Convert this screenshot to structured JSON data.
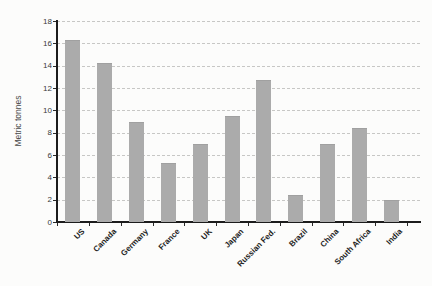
{
  "chart": {
    "ylabel": "Metric tonnes",
    "colors": {
      "bar": "#ababab",
      "axis": "#1c1c1c",
      "grid": "#c7c7c5",
      "y_tick_label": "#3a3a3a",
      "x_tick_label": "#222222",
      "background": "#fcfcfb"
    }
  },
  "chart_data": {
    "type": "bar",
    "categories": [
      "US",
      "Canada",
      "Germany",
      "France",
      "UK",
      "Japan",
      "Russian Fed.",
      "Brazil",
      "China",
      "South Africa",
      "India"
    ],
    "values": [
      16.3,
      14.2,
      9.0,
      5.3,
      7.0,
      9.5,
      12.7,
      2.4,
      7.0,
      8.4,
      2.0
    ],
    "title": "",
    "xlabel": "",
    "ylabel": "Metric tonnes",
    "ylim": [
      0,
      18
    ],
    "ytick_step": 2,
    "y_tick_labels": [
      "0",
      "2",
      "4",
      "6",
      "8",
      "10",
      "12",
      "14",
      "16",
      "18"
    ],
    "grid": "horizontal-dashed",
    "legend": "none",
    "x_label_rotation": -45
  }
}
